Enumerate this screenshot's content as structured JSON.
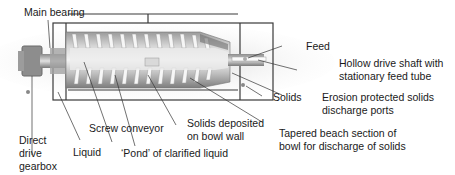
{
  "diagram": {
    "labels": {
      "main_bearing": "Main bearing",
      "feed": "Feed",
      "hollow_shaft_1": "Hollow drive shaft with",
      "hollow_shaft_2": "stationary feed tube",
      "solids": "Solids",
      "erosion_1": "Erosion protected solids",
      "erosion_2": "discharge ports",
      "direct_1": "Direct",
      "direct_2": "drive",
      "direct_3": "gearbox",
      "liquid": "Liquid",
      "screw_conveyor": "Screw conveyor",
      "solids_deposited_1": "Solids deposited",
      "solids_deposited_2": "on bowl wall",
      "pond": "‘Pond’ of clarified liquid",
      "tapered_1": "Tapered beach section of",
      "tapered_2": "bowl for discharge of solids"
    },
    "colors": {
      "leader_line": "#333333",
      "housing": "#3a3a3a",
      "bowl_light": "#e4e4e4",
      "bowl_dark": "#8a8a8a",
      "flight": "#f2f2f2"
    }
  }
}
